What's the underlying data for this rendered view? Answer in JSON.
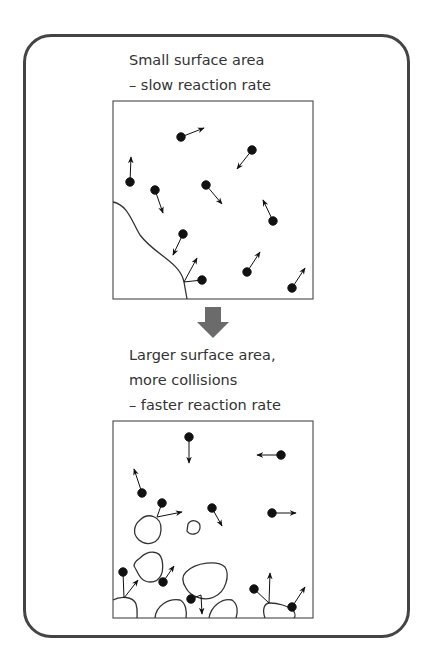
{
  "top_panel": {
    "caption_lines": [
      "Small surface area",
      "– slow reaction rate"
    ]
  },
  "bottom_panel": {
    "caption_lines": [
      "Larger surface area,",
      "more collisions",
      "– faster reaction rate"
    ]
  },
  "transition_arrow": {
    "icon": "down-arrow-icon",
    "color": "#6b6b6b"
  },
  "colors": {
    "frame": "#444444",
    "box": "#555555",
    "particle": "#111111",
    "text": "#333333"
  }
}
